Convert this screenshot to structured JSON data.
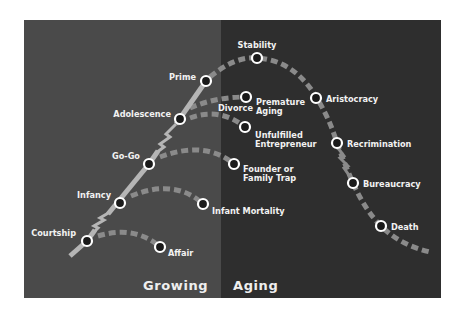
{
  "diagram": {
    "colors": {
      "growing_bg": "#4a4a4a",
      "aging_bg": "#2e2e2e",
      "curve": "#8a8a8a",
      "main_line": "#b5b5b5",
      "node_ring": "#ffffff",
      "node_fill": "#1a1a1a",
      "text": "#f2f2f2"
    },
    "phases": [
      {
        "label": "Growing"
      },
      {
        "label": "Aging"
      }
    ],
    "stages": [
      {
        "label": "Courtship"
      },
      {
        "label": "Infancy"
      },
      {
        "label": "Go-Go"
      },
      {
        "label": "Adolescence"
      },
      {
        "label": "Prime"
      },
      {
        "label": "Stability"
      },
      {
        "label": "Aristocracy"
      },
      {
        "label": "Recrimination"
      },
      {
        "label": "Bureaucracy"
      },
      {
        "label": "Death"
      }
    ],
    "pathologies": [
      {
        "label": "Affair"
      },
      {
        "label": "Infant Mortality"
      },
      {
        "label": "Founder or",
        "label2": "Family Trap"
      },
      {
        "label": "Divorce"
      },
      {
        "label": "Premature",
        "label2": "Aging"
      },
      {
        "label": "Unfulfilled",
        "label2": "Entrepreneur"
      }
    ]
  }
}
